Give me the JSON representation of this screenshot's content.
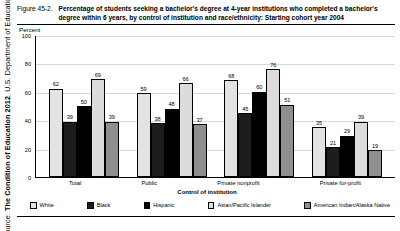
{
  "source_note": {
    "prefix": "Source: ",
    "emphasis": "The Condition of Education 2012",
    "suffix": ", U.S. Department of Education"
  },
  "figure": {
    "number": "Figure 45-2.",
    "title": "Percentage of students seeking a bachelor's degree at 4-year institutions who completed a bachelor's degree within 6 years, by control of institution and race/ethnicity: Starting cohort year 2004"
  },
  "colors": {
    "white_series": "#e3e3e3",
    "black_series": "#1d1d1d",
    "hispanic_series": "#000000",
    "asian_series": "#dcdcdc",
    "amerindian_series": "#8f8f8f",
    "axis": "#000000",
    "grid": "#d8d8d8",
    "page_background": "#ffffff"
  },
  "chart_data": {
    "type": "bar",
    "title": "Percentage of students seeking a bachelor's degree at 4-year institutions who completed a bachelor's degree within 6 years, by control of institution and race/ethnicity: Starting cohort year 2004",
    "xlabel": "Control of institution",
    "ylabel": "Percent",
    "ylim": [
      0,
      100
    ],
    "yticks": [
      0,
      20,
      40,
      60,
      80,
      100
    ],
    "ytick_labels": [
      "0",
      "20",
      "40",
      "60",
      "80",
      "100"
    ],
    "grid": true,
    "legend_position": "bottom",
    "categories": [
      "Total",
      "Public",
      "Private nonprofit",
      "Private for-profit"
    ],
    "series": [
      {
        "name": "White",
        "color": "#e3e3e3",
        "values": [
          62,
          59,
          68,
          35
        ]
      },
      {
        "name": "Black",
        "color": "#1d1d1d",
        "values": [
          39,
          38,
          45,
          21
        ]
      },
      {
        "name": "Hispanic",
        "color": "#000000",
        "values": [
          50,
          48,
          60,
          29
        ]
      },
      {
        "name": "Asian/Pacific Islander",
        "color": "#dcdcdc",
        "values": [
          69,
          66,
          76,
          39
        ]
      },
      {
        "name": "American Indian/Alaska Native",
        "color": "#8f8f8f",
        "values": [
          39,
          37,
          51,
          19
        ]
      }
    ]
  }
}
